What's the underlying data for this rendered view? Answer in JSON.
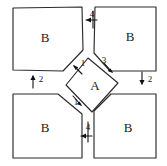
{
  "diagram": {
    "style": "hand-drawn line sketch",
    "background_color": "#ffffff",
    "line_color": "#2b2b2b",
    "text_color": "#111111",
    "regions": [
      {
        "id": "top-left",
        "label": "B",
        "shape": "square-chamfered-bottom-right"
      },
      {
        "id": "top-right",
        "label": "B",
        "shape": "square-chamfered-bottom-left"
      },
      {
        "id": "bottom-left",
        "label": "B",
        "shape": "square-chamfered-top-right"
      },
      {
        "id": "bottom-right",
        "label": "B",
        "shape": "square-chamfered-top-left"
      },
      {
        "id": "center",
        "label": "A",
        "shape": "diamond"
      }
    ],
    "flows": [
      {
        "id": "top-gap",
        "label": "4",
        "direction": "left",
        "position": "top-center"
      },
      {
        "id": "bottom-gap",
        "label": "4",
        "direction": "left",
        "position": "bottom-center"
      },
      {
        "id": "left-gap",
        "label": "2",
        "direction": "up",
        "position": "left-center"
      },
      {
        "id": "right-gap",
        "label": "2",
        "direction": "down",
        "position": "right-center"
      },
      {
        "id": "diamond-upper-left",
        "label": "1",
        "direction": "up-left",
        "position": "diamond-upper-left-edge"
      },
      {
        "id": "diamond-upper-right",
        "label": "3",
        "direction": "down-right",
        "position": "diamond-upper-right-edge"
      },
      {
        "id": "diamond-lower-left",
        "label": "1",
        "direction": "down-right",
        "position": "diamond-lower-left-edge"
      }
    ]
  }
}
